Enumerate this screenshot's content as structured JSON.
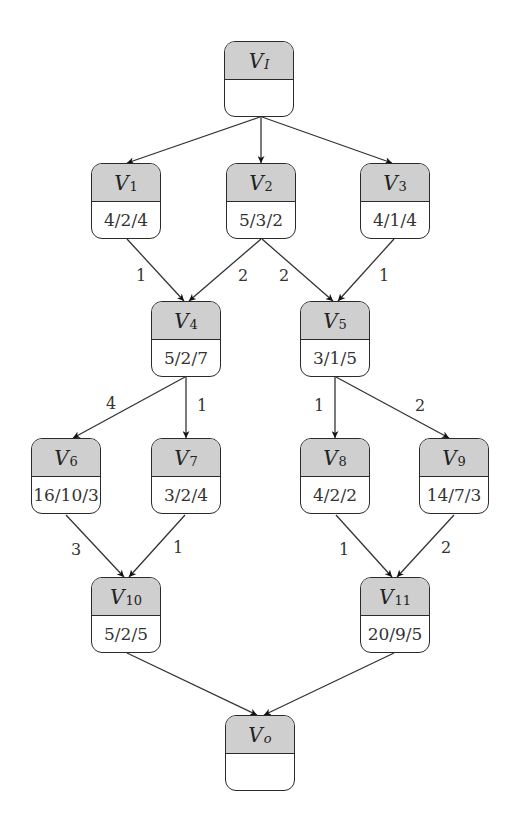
{
  "diagram": {
    "type": "directed-acyclic-graph",
    "nodes": [
      {
        "id": "VI",
        "label": "V",
        "sub": "I",
        "value": "",
        "x": 224,
        "y": 41
      },
      {
        "id": "V1",
        "label": "V",
        "sub": "1",
        "value": "4/2/4",
        "x": 91,
        "y": 163
      },
      {
        "id": "V2",
        "label": "V",
        "sub": "2",
        "value": "5/3/2",
        "x": 226,
        "y": 163
      },
      {
        "id": "V3",
        "label": "V",
        "sub": "3",
        "value": "4/1/4",
        "x": 360,
        "y": 163
      },
      {
        "id": "V4",
        "label": "V",
        "sub": "4",
        "value": "5/2/7",
        "x": 151,
        "y": 301
      },
      {
        "id": "V5",
        "label": "V",
        "sub": "5",
        "value": "3/1/5",
        "x": 300,
        "y": 301
      },
      {
        "id": "V6",
        "label": "V",
        "sub": "6",
        "value": "16/10/3",
        "x": 31,
        "y": 438
      },
      {
        "id": "V7",
        "label": "V",
        "sub": "7",
        "value": "3/2/4",
        "x": 151,
        "y": 438
      },
      {
        "id": "V8",
        "label": "V",
        "sub": "8",
        "value": "4/2/2",
        "x": 300,
        "y": 438
      },
      {
        "id": "V9",
        "label": "V",
        "sub": "9",
        "value": "14/7/3",
        "x": 419,
        "y": 438
      },
      {
        "id": "V10",
        "label": "V",
        "sub": "10",
        "value": "5/2/5",
        "x": 91,
        "y": 577
      },
      {
        "id": "V11",
        "label": "V",
        "sub": "11",
        "value": "20/9/5",
        "x": 360,
        "y": 577
      },
      {
        "id": "Vo",
        "label": "V",
        "sub": "o",
        "value": "",
        "x": 225,
        "y": 715
      }
    ],
    "edges": [
      {
        "from": "VI",
        "to": "V1",
        "weight": "",
        "x1": 260,
        "y1": 117,
        "x2": 127,
        "y2": 163
      },
      {
        "from": "VI",
        "to": "V2",
        "weight": "",
        "x1": 261,
        "y1": 117,
        "x2": 261,
        "y2": 163
      },
      {
        "from": "VI",
        "to": "V3",
        "weight": "",
        "x1": 262,
        "y1": 117,
        "x2": 392,
        "y2": 163
      },
      {
        "from": "V1",
        "to": "V4",
        "weight": "1",
        "x1": 127,
        "y1": 239,
        "x2": 184,
        "y2": 301,
        "lx": 141,
        "ly": 275
      },
      {
        "from": "V2",
        "to": "V4",
        "weight": "2",
        "x1": 261,
        "y1": 239,
        "x2": 189,
        "y2": 301,
        "lx": 243,
        "ly": 275
      },
      {
        "from": "V2",
        "to": "V5",
        "weight": "2",
        "x1": 262,
        "y1": 239,
        "x2": 333,
        "y2": 301,
        "lx": 284,
        "ly": 275
      },
      {
        "from": "V3",
        "to": "V5",
        "weight": "1",
        "x1": 394,
        "y1": 239,
        "x2": 338,
        "y2": 301,
        "lx": 384,
        "ly": 275
      },
      {
        "from": "V4",
        "to": "V6",
        "weight": "4",
        "x1": 185,
        "y1": 377,
        "x2": 73,
        "y2": 438,
        "lx": 111,
        "ly": 403
      },
      {
        "from": "V4",
        "to": "V7",
        "weight": "1",
        "x1": 186,
        "y1": 377,
        "x2": 186,
        "y2": 438,
        "lx": 202,
        "ly": 405
      },
      {
        "from": "V5",
        "to": "V8",
        "weight": "1",
        "x1": 335,
        "y1": 377,
        "x2": 335,
        "y2": 438,
        "lx": 319,
        "ly": 405
      },
      {
        "from": "V5",
        "to": "V9",
        "weight": "2",
        "x1": 336,
        "y1": 377,
        "x2": 449,
        "y2": 438,
        "lx": 420,
        "ly": 405
      },
      {
        "from": "V6",
        "to": "V10",
        "weight": "3",
        "x1": 66,
        "y1": 515,
        "x2": 124,
        "y2": 577,
        "lx": 76,
        "ly": 549
      },
      {
        "from": "V7",
        "to": "V10",
        "weight": "1",
        "x1": 185,
        "y1": 515,
        "x2": 129,
        "y2": 577,
        "lx": 178,
        "ly": 547
      },
      {
        "from": "V8",
        "to": "V11",
        "weight": "1",
        "x1": 336,
        "y1": 515,
        "x2": 392,
        "y2": 577,
        "lx": 344,
        "ly": 549
      },
      {
        "from": "V9",
        "to": "V11",
        "weight": "2",
        "x1": 454,
        "y1": 515,
        "x2": 397,
        "y2": 577,
        "lx": 446,
        "ly": 547
      },
      {
        "from": "V10",
        "to": "Vo",
        "weight": "",
        "x1": 127,
        "y1": 653,
        "x2": 257,
        "y2": 715
      },
      {
        "from": "V11",
        "to": "Vo",
        "weight": "",
        "x1": 394,
        "y1": 653,
        "x2": 264,
        "y2": 715
      }
    ],
    "colors": {
      "header_fill": "#cfcfcf",
      "stroke": "#2a2a2a",
      "body_fill": "#ffffff"
    }
  }
}
